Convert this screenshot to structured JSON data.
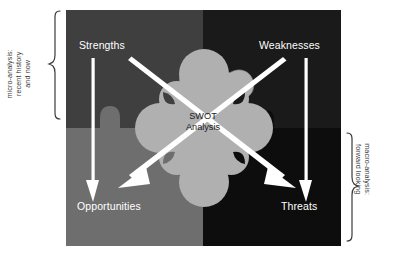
{
  "figure": {
    "center": {
      "line1": "SWOT",
      "line2": "Analysis"
    },
    "quadrants": [
      {
        "key": "strengths",
        "label": "Strengths",
        "color": "#3f3f3f",
        "position": "top-left"
      },
      {
        "key": "weaknesses",
        "label": "Weaknesses",
        "color": "#1a1a1a",
        "position": "top-right"
      },
      {
        "key": "opportunities",
        "label": "Opportunities",
        "color": "#6e6e6e",
        "position": "bottom-left"
      },
      {
        "key": "threats",
        "label": "Threats",
        "color": "#0d0d0d",
        "position": "bottom-right"
      }
    ],
    "side_labels": {
      "left": {
        "line1": "micro-analysis:",
        "line2": "recent history",
        "line3": "and now"
      },
      "right": {
        "line1": "macro-analysis:",
        "line2": "forward looking"
      }
    },
    "arrows": [
      {
        "name": "strengths-to-opportunities",
        "from": "Strengths",
        "to": "Opportunities",
        "style": "vertical"
      },
      {
        "name": "weaknesses-to-threats",
        "from": "Weaknesses",
        "to": "Threats",
        "style": "vertical"
      },
      {
        "name": "strengths-to-threats",
        "from": "Strengths",
        "to": "Threats",
        "style": "diagonal"
      },
      {
        "name": "weaknesses-to-opportunities",
        "from": "Weaknesses",
        "to": "Opportunities",
        "style": "diagonal"
      }
    ],
    "colors": {
      "blob": "#b0b0b0",
      "arrow": "#ffffff",
      "quad_strengths": "#3f3f3f",
      "quad_weaknesses": "#1a1a1a",
      "quad_opportunities": "#6e6e6e",
      "quad_threats": "#0d0d0d",
      "brace": "#3a3a3a",
      "label_text": "#ffffff",
      "center_text": "#1d1d1d"
    }
  }
}
